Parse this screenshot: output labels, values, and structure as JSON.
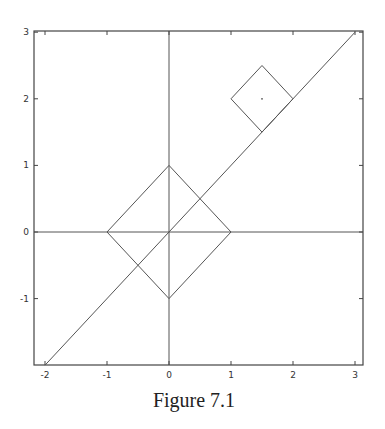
{
  "chart_data": {
    "type": "line",
    "title": "",
    "caption": "Figure 7.1",
    "xlabel": "",
    "ylabel": "",
    "xlim": [
      -2.2,
      3.1
    ],
    "ylim": [
      -2,
      3
    ],
    "grid": false,
    "x_ticks": [
      -2,
      -1,
      0,
      1,
      2,
      3
    ],
    "y_ticks": [
      -1,
      0,
      1,
      2,
      3
    ],
    "x_tick_labels": [
      "-2",
      "-1",
      "0",
      "1",
      "2",
      "3"
    ],
    "y_tick_labels": [
      "-1",
      "0",
      "1",
      "2",
      "3"
    ],
    "axes_lines": {
      "x_axis_at_y": 0,
      "y_axis_at_x": 0
    },
    "series": [
      {
        "name": "diagonal-line",
        "points": [
          [
            -2,
            -2
          ],
          [
            3,
            3
          ]
        ]
      },
      {
        "name": "large-diamond",
        "closed": true,
        "points": [
          [
            0,
            1
          ],
          [
            1,
            0
          ],
          [
            0,
            -1
          ],
          [
            -1,
            0
          ]
        ]
      },
      {
        "name": "small-square",
        "closed": true,
        "points": [
          [
            1.5,
            2.5
          ],
          [
            2,
            2
          ],
          [
            1.5,
            1.5
          ],
          [
            1,
            2
          ]
        ]
      }
    ],
    "markers": [
      {
        "name": "small-square-center",
        "point": [
          1.5,
          2
        ]
      }
    ],
    "colors": {
      "line": "#555555",
      "frame": "#444444"
    }
  }
}
